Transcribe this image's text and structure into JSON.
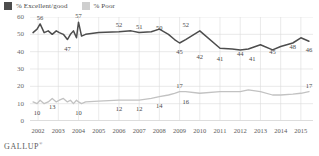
{
  "legend": {
    "items": [
      {
        "label": "% Excellent/good",
        "color": "#4d4d4d",
        "name": "legend-excellent-good"
      },
      {
        "label": "% Poor",
        "color": "#cfcfcf",
        "name": "legend-poor"
      }
    ]
  },
  "footer": {
    "brand": "GALLUP",
    "mark": "®"
  },
  "chart_data": {
    "type": "line",
    "title": "",
    "subtitle": "",
    "xlabel": "",
    "ylabel": "",
    "ylim": [
      0,
      60
    ],
    "yticks": [
      0,
      10,
      20,
      30,
      40,
      50,
      60
    ],
    "xlim": [
      2001.6,
      2015.6
    ],
    "xticks": [
      2002,
      2003,
      2004,
      2005,
      2006,
      2007,
      2008,
      2009,
      2010,
      2011,
      2012,
      2013,
      2014,
      2015
    ],
    "grid": true,
    "legend_position": "top-left",
    "series": [
      {
        "name": "% Excellent/good",
        "color": "#4d4d4d",
        "x": [
          2001.75,
          2001.95,
          2002.1,
          2002.3,
          2002.5,
          2002.7,
          2002.9,
          2003.05,
          2003.25,
          2003.45,
          2003.6,
          2003.75,
          2003.9,
          2004.0,
          2004.15,
          2004.35,
          2005.0,
          2006.0,
          2006.6,
          2007.0,
          2007.6,
          2008.0,
          2008.45,
          2008.75,
          2009.0,
          2009.3,
          2010.0,
          2011.0,
          2011.6,
          2012.0,
          2012.4,
          2013.0,
          2013.6,
          2014.0,
          2014.6,
          2015.0,
          2015.4
        ],
        "values": [
          51,
          53,
          56,
          51,
          52,
          50,
          52,
          51,
          50,
          47,
          50,
          52,
          48,
          57,
          49,
          50,
          51,
          51.5,
          52,
          51,
          51.5,
          53,
          50,
          47,
          45,
          47,
          52,
          42,
          41.5,
          41,
          41.5,
          44,
          41,
          43,
          45,
          48,
          46
        ],
        "labeled_points": [
          {
            "x": 2002.1,
            "y": 56,
            "label": "56"
          },
          {
            "x": 2004.0,
            "y": 57,
            "label": "57"
          },
          {
            "x": 2003.45,
            "y": 47,
            "label": "47"
          },
          {
            "x": 2006.0,
            "y": 52,
            "label": "52"
          },
          {
            "x": 2007.0,
            "y": 51,
            "label": "51"
          },
          {
            "x": 2008.0,
            "y": 50,
            "label": "50"
          },
          {
            "x": 2009.0,
            "y": 45,
            "label": "45"
          },
          {
            "x": 2009.3,
            "y": 52,
            "label": "52"
          },
          {
            "x": 2010.0,
            "y": 42,
            "label": "42"
          },
          {
            "x": 2011.0,
            "y": 41,
            "label": "41"
          },
          {
            "x": 2012.0,
            "y": 44,
            "label": "44"
          },
          {
            "x": 2012.6,
            "y": 41,
            "label": "41"
          },
          {
            "x": 2013.6,
            "y": 45,
            "label": "45"
          },
          {
            "x": 2014.6,
            "y": 48,
            "label": "48"
          },
          {
            "x": 2015.4,
            "y": 46,
            "label": "46"
          }
        ]
      },
      {
        "name": "% Poor",
        "color": "#c2c2c2",
        "x": [
          2001.75,
          2001.95,
          2002.1,
          2002.3,
          2002.5,
          2002.7,
          2002.9,
          2003.05,
          2003.25,
          2003.45,
          2003.6,
          2003.75,
          2003.9,
          2004.0,
          2004.15,
          2004.35,
          2005.0,
          2006.0,
          2006.6,
          2007.0,
          2007.6,
          2008.0,
          2008.45,
          2008.75,
          2009.0,
          2009.3,
          2010.0,
          2011.0,
          2011.6,
          2012.0,
          2012.4,
          2013.0,
          2013.6,
          2014.0,
          2014.6,
          2015.0,
          2015.4
        ],
        "values": [
          11,
          10,
          12,
          10,
          11,
          13,
          11,
          12,
          13,
          11,
          12,
          10,
          12,
          11,
          10,
          11,
          11.5,
          12,
          12,
          12,
          13,
          14,
          15,
          16,
          17,
          17,
          16,
          17,
          17,
          17,
          18,
          17,
          15,
          15,
          15.5,
          16,
          17
        ],
        "labeled_points": [
          {
            "x": 2002.7,
            "y": 13,
            "label": "13"
          },
          {
            "x": 2001.95,
            "y": 10,
            "label": "10"
          },
          {
            "x": 2004.0,
            "y": 10,
            "label": "10"
          },
          {
            "x": 2006.0,
            "y": 12,
            "label": "12"
          },
          {
            "x": 2007.0,
            "y": 12,
            "label": "12"
          },
          {
            "x": 2008.0,
            "y": 14,
            "label": "14"
          },
          {
            "x": 2009.0,
            "y": 17,
            "label": "17"
          },
          {
            "x": 2009.3,
            "y": 16,
            "label": "16"
          },
          {
            "x": 2015.4,
            "y": 17,
            "label": "17"
          }
        ]
      }
    ]
  }
}
